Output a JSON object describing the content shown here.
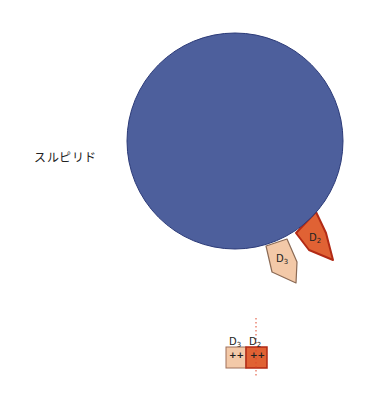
{
  "drug": {
    "name": "スルピリド"
  },
  "colors": {
    "molecule_fill": "#4d5f9c",
    "molecule_stroke": "#2b3a78",
    "d2_fill": "#e06234",
    "d2_stroke": "#b22a15",
    "d3_fill": "#f3c9a8",
    "d3_stroke": "#8b6a55",
    "dotted_line": "#e0472b"
  },
  "receptors": [
    {
      "id": "D2",
      "label": "D",
      "sub": "2"
    },
    {
      "id": "D3",
      "label": "D",
      "sub": "3"
    }
  ],
  "affinity_bar": {
    "items": [
      {
        "label": "D",
        "sub": "3",
        "value": "++"
      },
      {
        "label": "D",
        "sub": "2",
        "value": "++"
      }
    ]
  }
}
